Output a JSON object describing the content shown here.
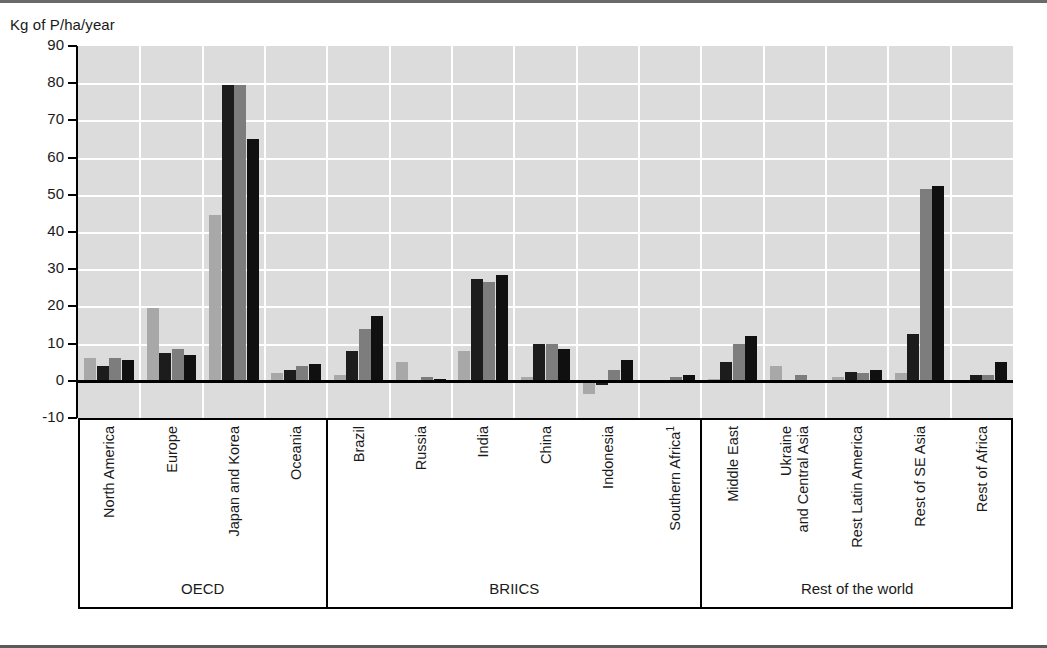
{
  "chart_data": {
    "type": "bar",
    "title": "",
    "xlabel": "",
    "ylabel": "Kg of P/ha/year",
    "ylim": [
      -10,
      90
    ],
    "ytick_labels": [
      "90",
      "80",
      "70",
      "60",
      "50",
      "40",
      "30",
      "20",
      "10",
      "0",
      "-10"
    ],
    "ytick_values": [
      90,
      80,
      70,
      60,
      50,
      40,
      30,
      20,
      10,
      0,
      -10
    ],
    "grid": true,
    "legend": "none",
    "categories": [
      "North America",
      "Europe",
      "Japan and Korea",
      "Oceania",
      "Brazil",
      "Russia",
      "India",
      "China",
      "Indonesia",
      "Southern Africa",
      "Middle East",
      "Ukraine and Central Asia",
      "Rest Latin America",
      "Rest of SE Asia",
      "Rest of Africa"
    ],
    "category_labels": [
      "North America",
      "Europe",
      "Japan and Korea",
      "Oceania",
      "Brazil",
      "Russia",
      "India",
      "China",
      "Indonesia",
      "Southern Africa",
      "Middle East",
      "Ukraine\nand Central Asia",
      "Rest Latin America",
      "Rest of SE Asia",
      "Rest of Africa"
    ],
    "category_footnote_marker": {
      "Southern Africa": "1"
    },
    "series": [
      {
        "name": "series-1",
        "color": "#a8a8a8",
        "values": [
          6.0,
          19.5,
          44.5,
          2.0,
          1.5,
          5.0,
          8.0,
          1.0,
          -3.5,
          0.3,
          0.5,
          4.0,
          1.0,
          2.0,
          0.3
        ]
      },
      {
        "name": "series-2",
        "color": "#1c1c1c",
        "values": [
          4.0,
          7.5,
          79.5,
          3.0,
          8.0,
          0.2,
          27.5,
          10.0,
          -1.0,
          0.2,
          5.0,
          0.2,
          2.5,
          12.5,
          1.5
        ]
      },
      {
        "name": "series-3",
        "color": "#7d7d7d",
        "values": [
          6.0,
          8.5,
          79.5,
          4.0,
          14.0,
          1.0,
          26.5,
          10.0,
          3.0,
          1.0,
          10.0,
          1.5,
          2.0,
          51.5,
          1.5
        ]
      },
      {
        "name": "series-4",
        "color": "#101010",
        "values": [
          5.5,
          7.0,
          65.0,
          4.5,
          17.5,
          0.5,
          28.5,
          8.5,
          5.5,
          1.5,
          12.0,
          0.2,
          3.0,
          52.5,
          5.0
        ]
      }
    ],
    "groups": [
      {
        "label": "OECD",
        "categories": [
          "North America",
          "Europe",
          "Japan and Korea",
          "Oceania"
        ]
      },
      {
        "label": "BRIICS",
        "categories": [
          "Brazil",
          "Russia",
          "India",
          "China",
          "Indonesia",
          "Southern Africa"
        ]
      },
      {
        "label": "Rest of the world",
        "categories": [
          "Middle East",
          "Ukraine and Central Asia",
          "Rest Latin America",
          "Rest of SE Asia",
          "Rest of Africa"
        ]
      }
    ]
  },
  "group_labels": [
    "OECD",
    "BRIICS",
    "Rest of the world"
  ]
}
